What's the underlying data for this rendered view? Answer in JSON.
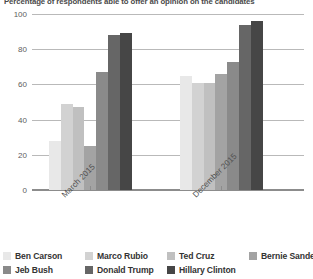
{
  "chart_data": {
    "type": "bar",
    "title": "Percentage of respondents able to offer an opinion on the candidates",
    "xlabel": "",
    "ylabel": "",
    "ylim": [
      0,
      100
    ],
    "yticks": [
      0,
      20,
      40,
      60,
      80,
      100
    ],
    "ytick_labels": [
      "0",
      "20",
      "40",
      "60",
      "80",
      "100"
    ],
    "grid": true,
    "legend_position": "bottom",
    "categories": [
      "March 2015",
      "December 2015"
    ],
    "series": [
      {
        "name": "Ben Carson",
        "color": "#e8e8e8",
        "values": [
          28,
          65
        ]
      },
      {
        "name": "Marco Rubio",
        "color": "#d2d2d2",
        "values": [
          49,
          61
        ]
      },
      {
        "name": "Ted Cruz",
        "color": "#c0c0c0",
        "values": [
          47,
          61
        ]
      },
      {
        "name": "Bernie Sanders",
        "color": "#a3a3a3",
        "values": [
          25,
          66
        ]
      },
      {
        "name": "Jeb Bush",
        "color": "#8a8a8a",
        "values": [
          67,
          73
        ]
      },
      {
        "name": "Donald Trump",
        "color": "#666666",
        "values": [
          88,
          94
        ]
      },
      {
        "name": "Hillary Clinton",
        "color": "#464646",
        "values": [
          89,
          96
        ]
      }
    ]
  },
  "legend": {
    "items": [
      {
        "label": "Ben Carson",
        "color": "#e8e8e8"
      },
      {
        "label": "Marco Rubio",
        "color": "#d2d2d2"
      },
      {
        "label": "Ted Cruz",
        "color": "#c0c0c0"
      },
      {
        "label": "Bernie Sanders",
        "color": "#a3a3a3"
      },
      {
        "label": "Jeb Bush",
        "color": "#8a8a8a"
      },
      {
        "label": "Donald Trump",
        "color": "#666666"
      },
      {
        "label": "Hillary Clinton",
        "color": "#464646"
      }
    ]
  }
}
